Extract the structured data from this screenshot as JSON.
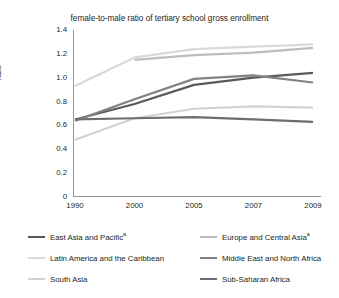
{
  "chart_data": {
    "type": "line",
    "title": "female-to-male ratio of tertiary school gross enrollment",
    "xlabel": "",
    "ylabel": "ratio",
    "categories": [
      "1990",
      "2000",
      "2005",
      "2007",
      "2009"
    ],
    "ylim": [
      0,
      1.4
    ],
    "ytick_labels": [
      "0",
      "0.2",
      "0.4",
      "0.6",
      "0.8",
      "1.0",
      "1.2",
      "1.4"
    ],
    "ytick_values": [
      0,
      0.2,
      0.4,
      0.6,
      0.8,
      1.0,
      1.2,
      1.4
    ],
    "grid": false,
    "legend_position": "bottom",
    "series": [
      {
        "name": "East Asia and Pacific",
        "superscript": "a",
        "color": "#58595b",
        "values": [
          0.65,
          0.78,
          0.94,
          1.0,
          1.04
        ]
      },
      {
        "name": "Europe and Central Asia",
        "superscript": "a",
        "color": "#bcbec0",
        "values": [
          null,
          1.15,
          1.19,
          1.21,
          1.25
        ]
      },
      {
        "name": "Latin America and the Caribbean",
        "superscript": "",
        "color": "#d8d9da",
        "values": [
          0.93,
          1.17,
          1.24,
          1.26,
          1.28
        ]
      },
      {
        "name": "Middle East and North Africa",
        "superscript": "",
        "color": "#808285",
        "values": [
          0.64,
          0.82,
          0.99,
          1.02,
          0.96
        ]
      },
      {
        "name": "South Asia",
        "superscript": "",
        "color": "#d0d2d3",
        "values": [
          0.48,
          0.66,
          0.74,
          0.76,
          0.75
        ]
      },
      {
        "name": "Sub-Saharan Africa",
        "superscript": "",
        "color": "#6d6e71",
        "values": [
          0.65,
          0.66,
          0.67,
          0.65,
          0.63
        ]
      }
    ]
  },
  "axis": {
    "line_color": "#939598"
  }
}
